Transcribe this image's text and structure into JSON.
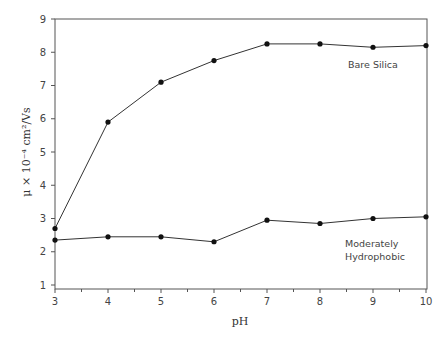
{
  "chart_data": {
    "type": "line",
    "title": "",
    "xlabel": "pH",
    "ylabel": "μ × 10⁻⁴ cm²/Vs",
    "xlim": [
      3,
      10
    ],
    "ylim": [
      0.88,
      9
    ],
    "x_ticks": [
      3,
      4,
      5,
      6,
      7,
      8,
      9,
      10
    ],
    "y_ticks": [
      1,
      2,
      3,
      4,
      5,
      6,
      7,
      8,
      9
    ],
    "x_minor_ticks": true,
    "grid": false,
    "frame": "box",
    "legend": "none (inline labels)",
    "x": [
      3,
      4,
      5,
      6,
      7,
      8,
      9,
      10
    ],
    "series": [
      {
        "name": "Bare Silica",
        "values": [
          2.7,
          5.9,
          7.1,
          7.75,
          8.25,
          8.25,
          8.15,
          8.2
        ],
        "marker": "circle",
        "label_position": {
          "x": 8.6,
          "y": 7.6
        }
      },
      {
        "name": "Moderately Hydrophobic",
        "values": [
          2.35,
          2.45,
          2.45,
          2.3,
          2.95,
          2.85,
          3.0,
          3.05
        ],
        "marker": "circle",
        "label_position": {
          "x": 8.5,
          "y": 2.3
        }
      }
    ]
  },
  "labels": {
    "series_1": "Bare Silica",
    "series_2_line1": "Moderately",
    "series_2_line2": "Hydrophobic",
    "xlabel": "pH",
    "ylabel": "μ × 10⁻⁴ cm²/Vs"
  },
  "style": {
    "line_color": "#333333",
    "marker_color": "#111111",
    "frame_color": "#555555",
    "text_color": "#444444"
  }
}
